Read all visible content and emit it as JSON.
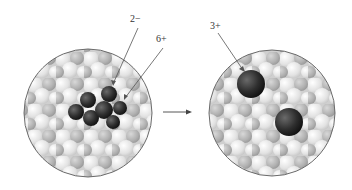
{
  "diagram": {
    "title": "",
    "left_panel": {
      "description": "Solid lattice containing a dichromate-like polyatomic anion cluster",
      "labels": [
        {
          "id": "anion-charge",
          "text": "2−"
        },
        {
          "id": "central-atom-charge",
          "text": "6+"
        }
      ]
    },
    "transition_arrow": {
      "direction": "right"
    },
    "right_panel": {
      "description": "Solid lattice containing two separated cations",
      "labels": [
        {
          "id": "cation-charge",
          "text": "3+"
        }
      ]
    },
    "colors": {
      "lattice_light": "#e6e6e6",
      "lattice_mid": "#bdbdbd",
      "ion_dark": "#2a2a2a",
      "circle_border": "#6a6a6a",
      "leader_line": "#555555"
    }
  }
}
